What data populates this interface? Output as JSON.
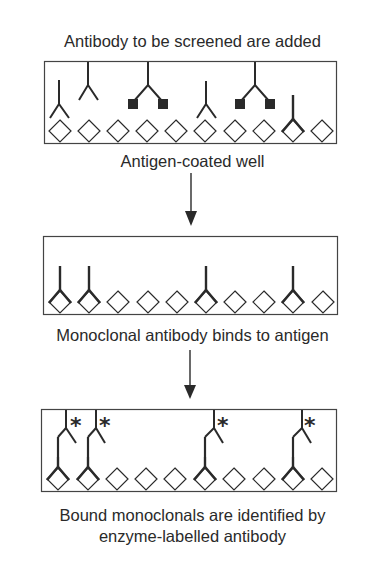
{
  "diagram": {
    "steps": [
      {
        "caption_top": "Antibody to be screened are added",
        "caption_bottom": "Antigen-coated well",
        "well": {
          "antigen_count": 10,
          "antigen_shape": "diamond",
          "antibodies": [
            {
              "position": 0,
              "type": "free",
              "state": "unbound-low"
            },
            {
              "position": 1,
              "type": "free",
              "state": "unbound-high"
            },
            {
              "position": 3,
              "type": "blocked",
              "state": "unbound-with-squares"
            },
            {
              "position": 5,
              "type": "free",
              "state": "unbound-low"
            },
            {
              "position": 6.5,
              "type": "blocked",
              "state": "unbound-with-squares"
            },
            {
              "position": 8,
              "type": "bound",
              "state": "bound"
            }
          ]
        }
      },
      {
        "caption_bottom": "Monoclonal antibody binds to antigen",
        "well": {
          "antigen_count": 10,
          "bound_positions": [
            0,
            1,
            5,
            8
          ]
        }
      },
      {
        "caption_bottom": [
          "Bound monoclonals are identified by",
          "enzyme-labelled antibody"
        ],
        "well": {
          "antigen_count": 10,
          "bound_positions": [
            0,
            1,
            5,
            8
          ],
          "enzyme_label": "*"
        }
      }
    ],
    "colors": {
      "stroke": "#2a2a2a",
      "background": "#ffffff"
    }
  }
}
